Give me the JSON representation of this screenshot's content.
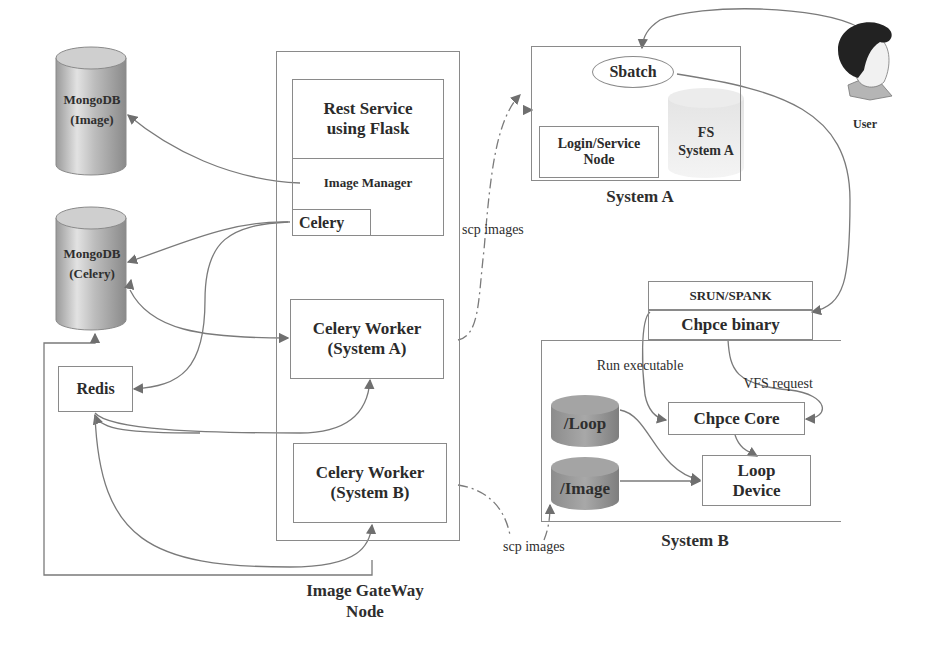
{
  "diagram": {
    "databases": {
      "mongo_image": {
        "line1": "MongoDB",
        "line2": "(Image)"
      },
      "mongo_celery": {
        "line1": "MongoDB",
        "line2": "(Celery)"
      },
      "fs_system_a": {
        "line1": "FS",
        "line2": "System A"
      },
      "loop": {
        "label": "/Loop"
      },
      "image": {
        "label": "/Image"
      }
    },
    "redis": {
      "label": "Redis"
    },
    "gateway": {
      "title_line1": "Image GateWay",
      "title_line2": "Node",
      "rest_service_line1": "Rest Service",
      "rest_service_line2": "using Flask",
      "image_manager": "Image Manager",
      "celery": "Celery",
      "worker_a_line1": "Celery Worker",
      "worker_a_line2": "(System A)",
      "worker_b_line1": "Celery Worker",
      "worker_b_line2": "(System B)"
    },
    "system_a": {
      "title": "System A",
      "sbatch": "Sbatch",
      "login_line1": "Login/Service",
      "login_line2": "Node"
    },
    "system_b": {
      "title": "System B",
      "srun": "SRUN/SPANK",
      "chpce_binary": "Chpce binary",
      "chpce_core": "Chpce Core",
      "loop_device_line1": "Loop",
      "loop_device_line2": "Device",
      "run_executable": "Run executable",
      "vfs_request": "VFS request"
    },
    "edge_labels": {
      "scp_a": "scp images",
      "scp_b": "scp images"
    },
    "user": {
      "label": "User"
    },
    "colors": {
      "line": "#7a7a7a",
      "box_border": "#8a8a8a",
      "text": "#2e2e2e",
      "cylinder_light": "#d6d6d6",
      "cylinder_dark": "#8f8f8f"
    }
  }
}
